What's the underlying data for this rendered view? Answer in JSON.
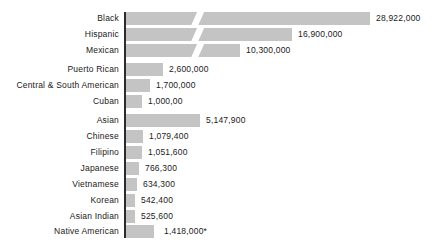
{
  "chart_data": {
    "type": "bar",
    "orientation": "horizontal",
    "title": "",
    "subtitle": "",
    "xlabel": "",
    "ylabel": "",
    "grid": false,
    "legend": null,
    "axis_ticks": [],
    "note": "Bars for Black, Hispanic and Mexican are drawn with a diagonal scale-break slash; the Native American bar is drawn off-scale.",
    "categories": [
      "Black",
      "Hispanic",
      "Mexican",
      "Puerto Rican",
      "Central & South American",
      "Cuban",
      "Asian",
      "Chinese",
      "Filipino",
      "Japanese",
      "Vietnamese",
      "Korean",
      "Asian Indian",
      "Native American"
    ],
    "values": [
      28922000,
      16900000,
      10300000,
      2600000,
      1700000,
      1000000,
      5147900,
      1079400,
      1051600,
      766300,
      634300,
      542400,
      525600,
      1418000
    ],
    "value_labels": [
      "28,922,000",
      "16,900,000",
      "10,300,000",
      "2,600,000",
      "1,700,000",
      "1,000,00",
      "5,147,900",
      "1,079,400",
      "1,051,600",
      "766,300",
      "634,300",
      "542,400",
      "525,600",
      "1,418,000*"
    ]
  },
  "rows": [
    {
      "label": "Black",
      "value_label": "28,922,000",
      "top": 12,
      "bar_width": 244,
      "broken": true,
      "label_gap": 6
    },
    {
      "label": "Hispanic",
      "value_label": "16,900,000",
      "top": 28,
      "bar_width": 166,
      "broken": true,
      "label_gap": 6
    },
    {
      "label": "Mexican",
      "value_label": "10,300,000",
      "top": 44,
      "bar_width": 114,
      "broken": true,
      "label_gap": 6
    },
    {
      "label": "Puerto Rican",
      "value_label": "2,600,000",
      "top": 63,
      "bar_width": 37,
      "broken": false,
      "label_gap": 6
    },
    {
      "label": "Central & South American",
      "value_label": "1,700,000",
      "top": 79,
      "bar_width": 24,
      "broken": false,
      "label_gap": 6
    },
    {
      "label": "Cuban",
      "value_label": "1,000,00",
      "top": 95,
      "bar_width": 16,
      "broken": false,
      "label_gap": 6
    },
    {
      "label": "Asian",
      "value_label": "5,147,900",
      "top": 114,
      "bar_width": 74,
      "broken": false,
      "label_gap": 6
    },
    {
      "label": "Chinese",
      "value_label": "1,079,400",
      "top": 130,
      "bar_width": 17,
      "broken": false,
      "label_gap": 6
    },
    {
      "label": "Filipino",
      "value_label": "1,051,600",
      "top": 146,
      "bar_width": 16,
      "broken": false,
      "label_gap": 6
    },
    {
      "label": "Japanese",
      "value_label": "766,300",
      "top": 162,
      "bar_width": 13,
      "broken": false,
      "label_gap": 6
    },
    {
      "label": "Vietnamese",
      "value_label": "634,300",
      "top": 178,
      "bar_width": 11,
      "broken": false,
      "label_gap": 6
    },
    {
      "label": "Korean",
      "value_label": "542,400",
      "top": 194,
      "bar_width": 9,
      "broken": false,
      "label_gap": 6
    },
    {
      "label": "Asian Indian",
      "value_label": "525,600",
      "top": 210,
      "bar_width": 9,
      "broken": false,
      "label_gap": 6
    },
    {
      "label": "Native American",
      "value_label": "1,418,000*",
      "top": 225,
      "bar_width": 28,
      "broken": false,
      "label_gap": 10
    }
  ],
  "colors": {
    "bar_fill": "#c4c4c4",
    "axis": "#2b2b2b",
    "text": "#1a1a1a",
    "background": "#ffffff"
  }
}
